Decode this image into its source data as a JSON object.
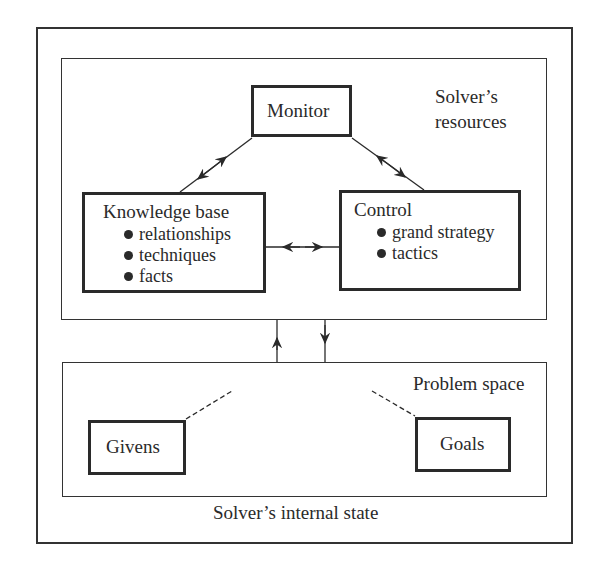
{
  "outer": {
    "label": "Solver’s internal state"
  },
  "resources": {
    "label_line1": "Solver’s",
    "label_line2": "resources",
    "monitor": {
      "title": "Monitor"
    },
    "knowledge_base": {
      "title": "Knowledge base",
      "items": [
        "relationships",
        "techniques",
        "facts"
      ]
    },
    "control": {
      "title": "Control",
      "items": [
        "grand strategy",
        "tactics"
      ]
    }
  },
  "problem_space": {
    "label": "Problem space",
    "givens": {
      "title": "Givens"
    },
    "goals": {
      "title": "Goals"
    }
  },
  "colors": {
    "ink": "#2a2a2a",
    "background": "#ffffff"
  }
}
